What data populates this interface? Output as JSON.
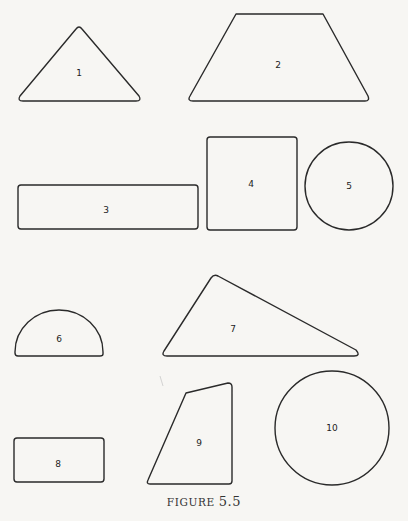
{
  "figure": {
    "caption_prefix": "FIGURE",
    "caption_number": "5.5"
  },
  "shapes": [
    {
      "id": "1",
      "kind": "triangle",
      "label": "1"
    },
    {
      "id": "2",
      "kind": "trapezoid",
      "label": "2"
    },
    {
      "id": "3",
      "kind": "rectangle",
      "label": "3"
    },
    {
      "id": "4",
      "kind": "square",
      "label": "4"
    },
    {
      "id": "5",
      "kind": "circle",
      "label": "5"
    },
    {
      "id": "6",
      "kind": "semicircle",
      "label": "6"
    },
    {
      "id": "7",
      "kind": "triangle",
      "label": "7"
    },
    {
      "id": "8",
      "kind": "rectangle",
      "label": "8"
    },
    {
      "id": "9",
      "kind": "quadrilateral",
      "label": "9"
    },
    {
      "id": "10",
      "kind": "circle",
      "label": "10"
    }
  ],
  "colors": {
    "stroke": "#2a2a2a",
    "background": "#f7f6f3"
  }
}
